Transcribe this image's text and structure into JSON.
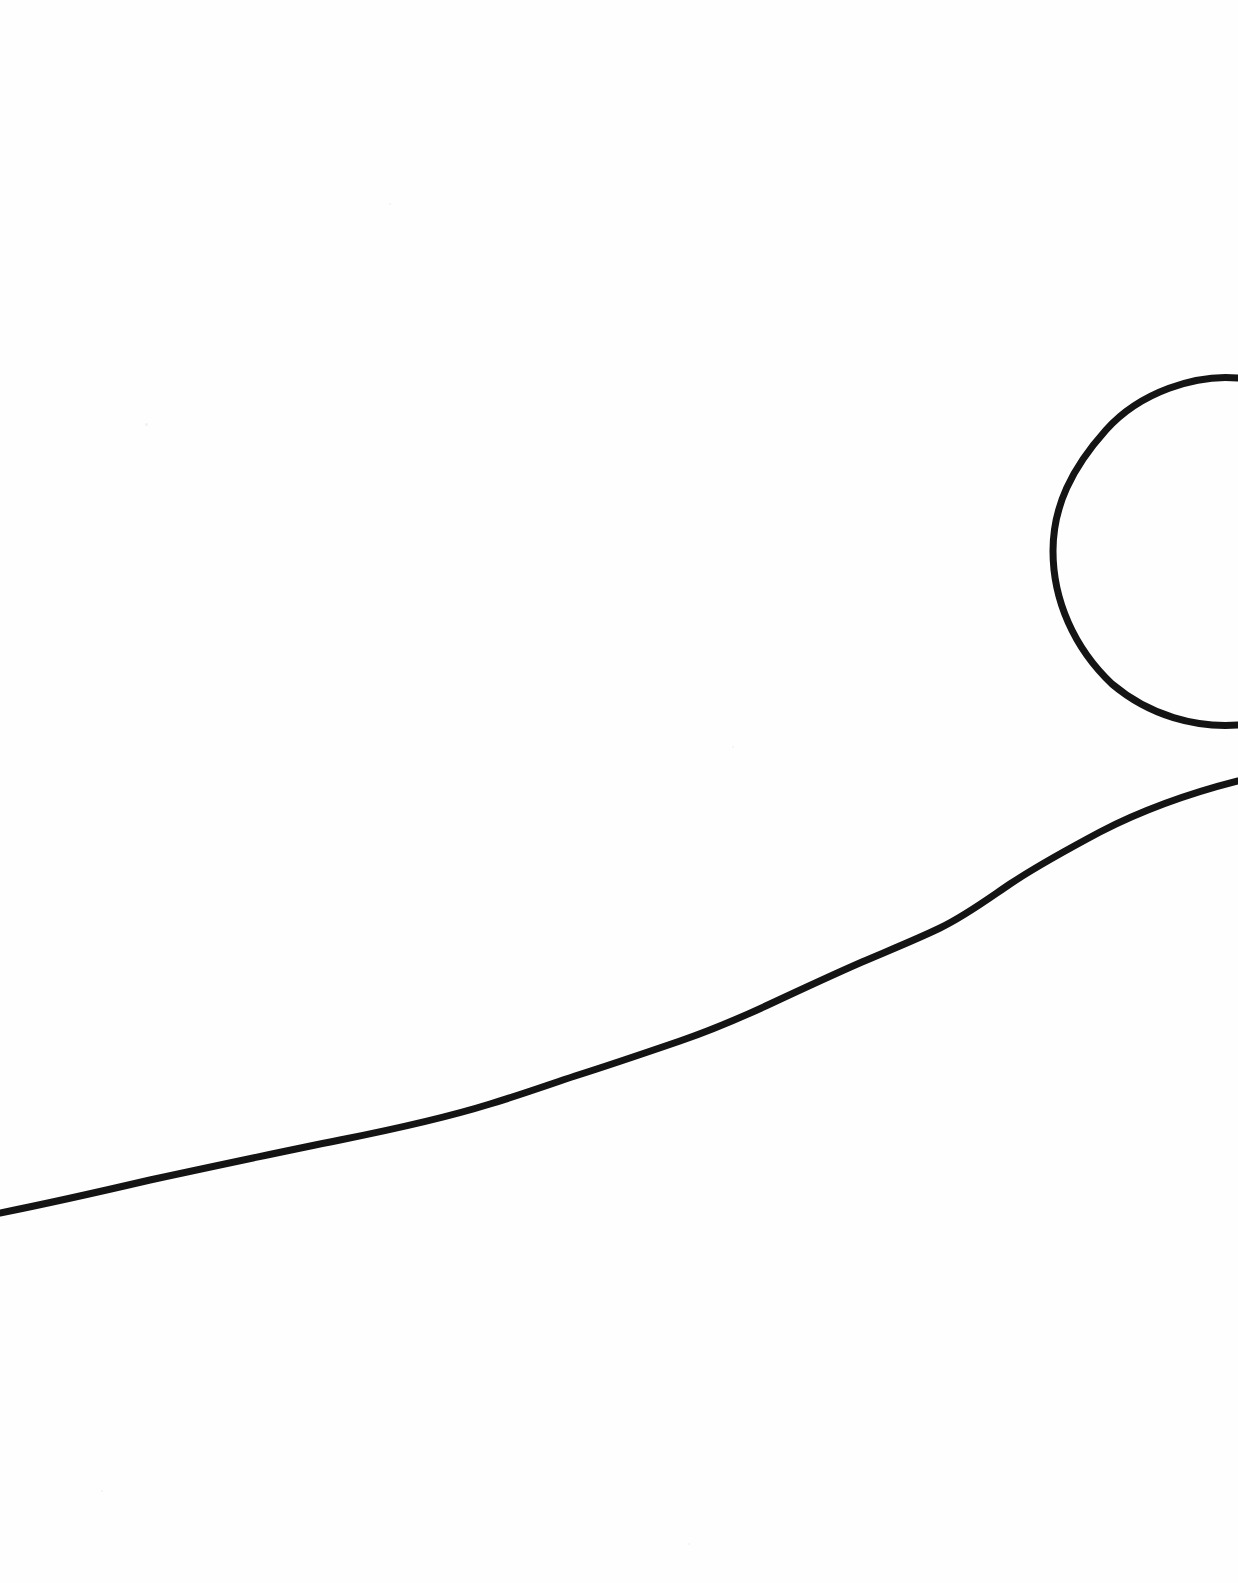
{
  "document": {
    "title": "Hand-drawn sketch scan",
    "medium": "ink on white paper",
    "canvas_width": 1238,
    "canvas_height": 1583,
    "background_color": "#fefefe",
    "ink_color": "#141414"
  },
  "drawing": {
    "description": "A sparse black-ink line drawing on a blank white page: a large open circular arc in the upper right, clipped by the right page edge, and a long gently undulating diagonal line running from the lower left edge upward to the right edge just below the arc.",
    "stroke_color": "#141414",
    "elements": [
      {
        "name": "circle-arc",
        "kind": "arc",
        "stroke_width": 7,
        "clipped_edges": [
          "right"
        ],
        "center_estimate": [
          1245,
          551
        ],
        "radius_estimate": 192,
        "leftmost_point": [
          1053,
          548
        ],
        "top_exit_point": [
          1238,
          381
        ],
        "bottom_exit_point": [
          1238,
          724
        ],
        "path": "M 1238 378 C 1196 374, 1140 392, 1106 430 C 1072 468, 1053 506, 1053 551 C 1053 600, 1074 648, 1112 684 C 1150 716, 1196 728, 1238 725"
      },
      {
        "name": "diagonal-line",
        "kind": "freehand-line",
        "stroke_width": 7,
        "clipped_edges": [
          "left",
          "right"
        ],
        "start_point": [
          0,
          1213
        ],
        "end_point": [
          1238,
          780
        ],
        "path": "M 0 1213 C 40 1205, 90 1194, 150 1180 C 215 1166, 280 1152, 340 1140 C 395 1129, 445 1118, 490 1104 C 520 1095, 545 1086, 575 1076 C 610 1065, 645 1053, 680 1041 C 712 1030, 740 1018, 770 1004 C 800 990, 830 976, 862 962 C 890 950, 915 940, 940 928 C 965 916, 985 901, 1010 884 C 1040 864, 1070 848, 1100 832 C 1135 814, 1175 797, 1238 781"
      }
    ]
  },
  "artifacts": {
    "description": "Faint scanner specks on otherwise blank paper",
    "specks": [
      {
        "x": 145,
        "y": 423,
        "size": 3
      },
      {
        "x": 389,
        "y": 203,
        "size": 2
      },
      {
        "x": 732,
        "y": 746,
        "size": 2
      },
      {
        "x": 101,
        "y": 1490,
        "size": 2
      },
      {
        "x": 688,
        "y": 1543,
        "size": 2
      }
    ]
  }
}
